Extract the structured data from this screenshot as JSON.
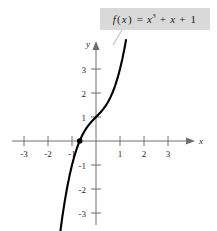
{
  "figure": {
    "background_color": "#ffffff",
    "label_box": {
      "text": "f(x) = x3 + x + 1",
      "function_name": "f",
      "variable": "x",
      "equals": "=",
      "term1_base": "x",
      "term1_exponent": "3",
      "plus1": "+",
      "term2": "x",
      "plus2": "+",
      "term3": "1",
      "background_color": "#d9d9d9",
      "text_color": "#1a1a1a"
    },
    "leader_line": {
      "name": "callout-leader-line",
      "color": "#c9c9c9"
    }
  },
  "chart_data": {
    "type": "line",
    "title": "",
    "subtitle": "",
    "xlabel": "x",
    "ylabel": "y",
    "annotations": [
      {
        "text": "f(x) = x3 + x + 1",
        "type": "callout-label",
        "target_x": 1.05,
        "target_y": 2.85
      },
      {
        "text": "",
        "type": "point-marker",
        "x": -0.68,
        "y": 0,
        "description": "real zero of f"
      }
    ],
    "xlim": [
      -3.7,
      4.2
    ],
    "ylim": [
      -3.75,
      4.0
    ],
    "grid": false,
    "legend": false,
    "legend_position": "none",
    "xticks": [
      -3,
      -2,
      -1,
      1,
      2,
      3
    ],
    "xtick_labels": [
      "-3",
      "-2",
      "-1",
      "1",
      "2",
      "3"
    ],
    "yticks": [
      3,
      2,
      1,
      -1,
      -2,
      -3
    ],
    "ytick_labels": [
      "3",
      "2",
      "1",
      "-1",
      "-2",
      "-3"
    ],
    "series": [
      {
        "name": "f(x) = x^3 + x + 1",
        "color": "#000000",
        "x": [
          -1.55,
          -1.5,
          -1.4,
          -1.3,
          -1.2,
          -1.1,
          -1.0,
          -0.9,
          -0.8,
          -0.7,
          -0.6,
          -0.5,
          -0.4,
          -0.3,
          -0.2,
          -0.1,
          0.0,
          0.1,
          0.2,
          0.3,
          0.4,
          0.5,
          0.6,
          0.7,
          0.8,
          0.9,
          1.0,
          1.1,
          1.2,
          1.25
        ],
        "y": [
          -4.27,
          -3.88,
          -3.14,
          -2.497,
          -1.928,
          -1.431,
          -1.0,
          -0.629,
          -0.312,
          -0.043,
          0.184,
          0.375,
          0.536,
          0.673,
          0.792,
          0.899,
          1.0,
          1.101,
          1.208,
          1.327,
          1.464,
          1.625,
          1.816,
          2.043,
          2.312,
          2.629,
          3.0,
          3.431,
          3.928,
          4.203
        ]
      }
    ]
  }
}
